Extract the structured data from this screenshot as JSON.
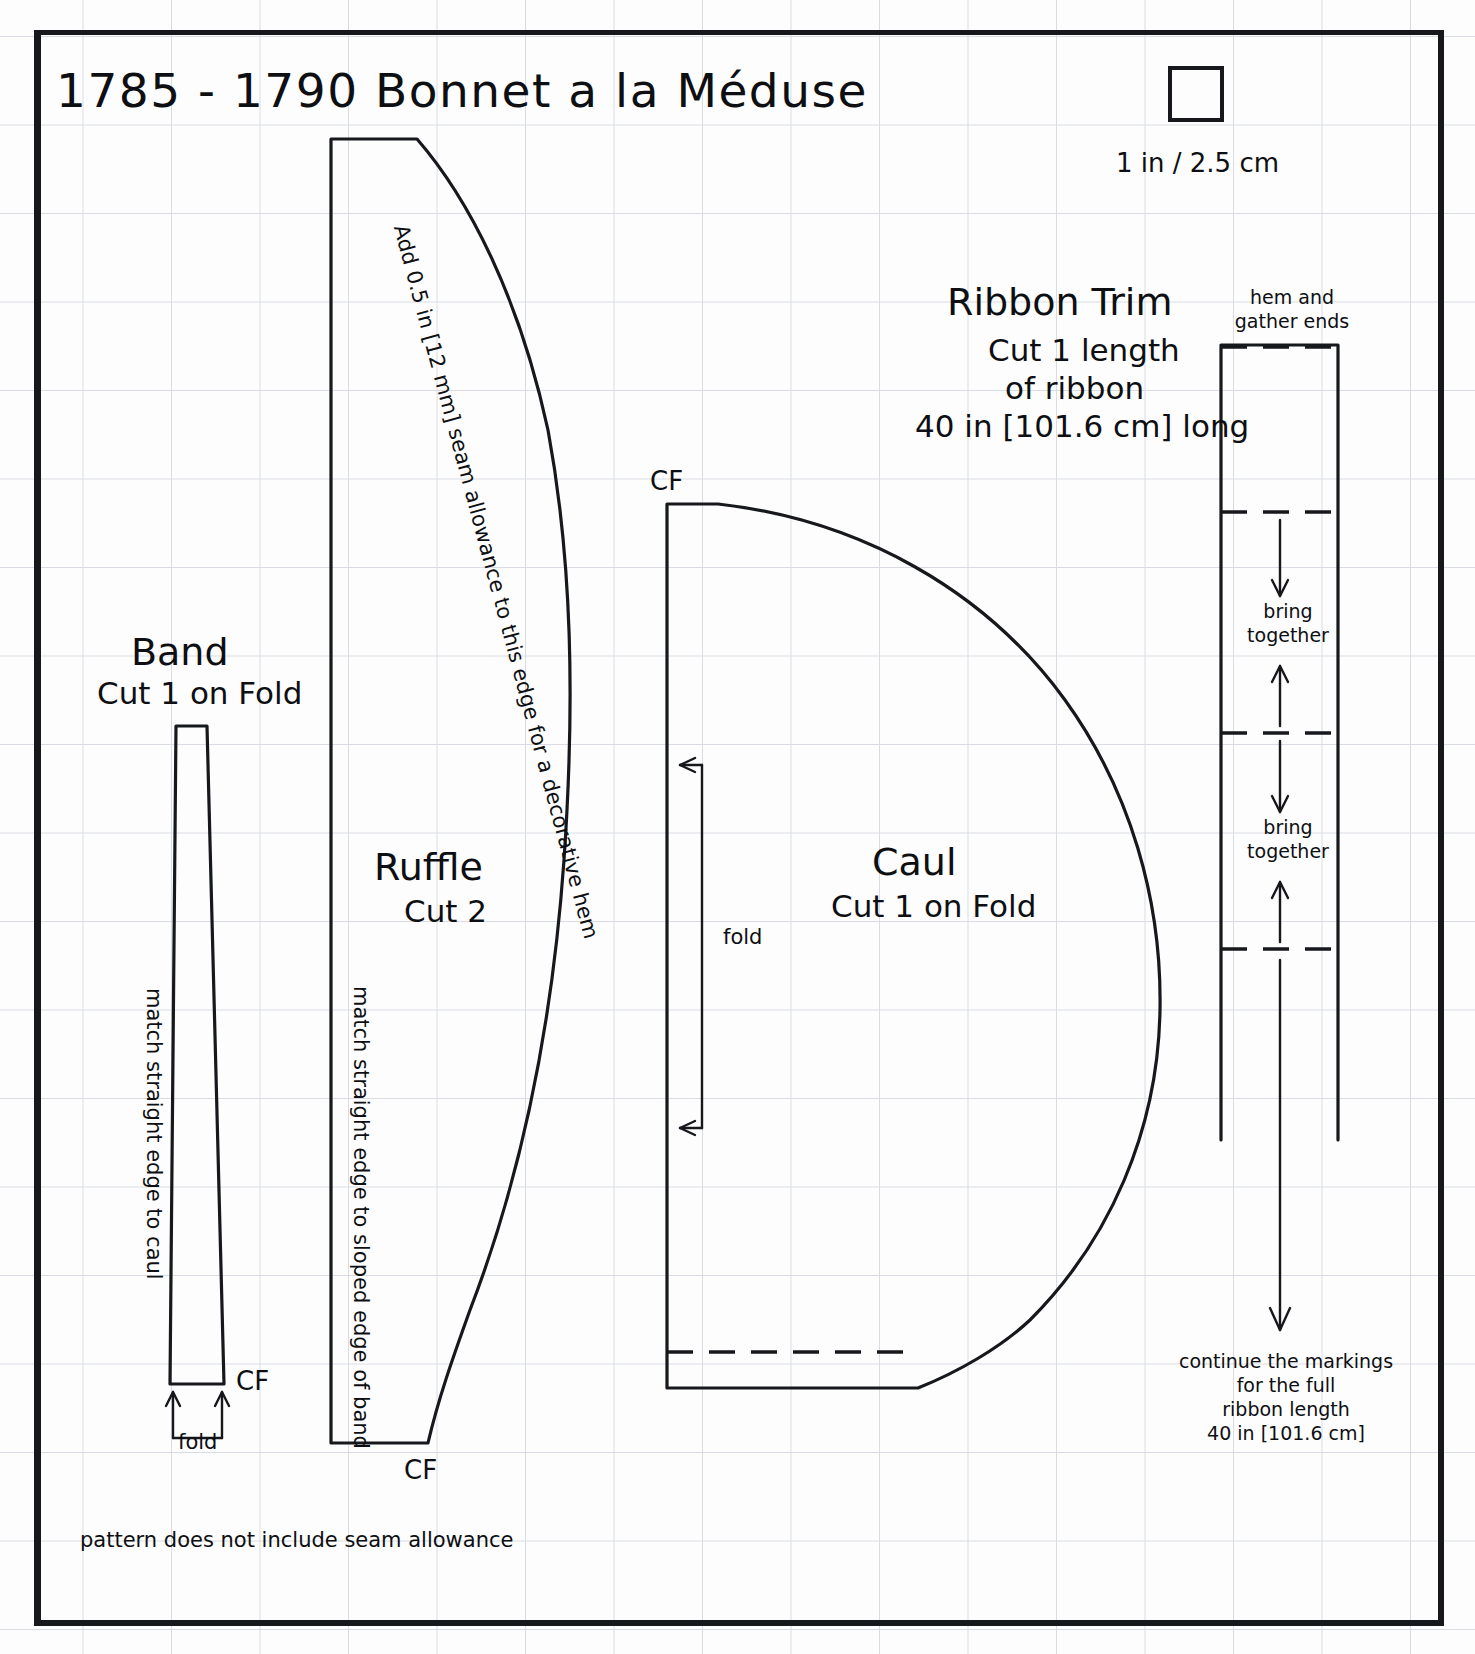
{
  "document": {
    "title": "1785 - 1790 Bonnet a la Méduse",
    "footer_note": "pattern does not include seam allowance"
  },
  "scale": {
    "label": "1 in / 2.5 cm",
    "box_name": "one-inch-scale-square"
  },
  "pieces": {
    "band": {
      "name": "Band",
      "cut": "Cut 1 on Fold",
      "grain_note": "match straight edge to caul",
      "cf_marker": "CF",
      "fold_marker": "fold"
    },
    "ruffle": {
      "name": "Ruffle",
      "cut": "Cut 2",
      "grain_note": "match straight edge to sloped edge of band",
      "seam_note": "Add 0.5 in [12 mm] seam allowance to this edge for a decorative hem",
      "cf_marker": "CF"
    },
    "caul": {
      "name": "Caul",
      "cut": "Cut 1 on Fold",
      "cf_marker": "CF",
      "fold_marker": "fold"
    },
    "ribbon": {
      "name": "Ribbon Trim",
      "cut_line_1": "Cut 1 length",
      "cut_line_2": "of ribbon",
      "length": "40 in [101.6 cm] long",
      "hem_note_line_1": "hem and",
      "hem_note_line_2": "gather ends",
      "bring_together_1_line_1": "bring",
      "bring_together_1_line_2": "together",
      "bring_together_2_line_1": "bring",
      "bring_together_2_line_2": "together",
      "continue_note_line_1": "continue the markings",
      "continue_note_line_2": "for the full",
      "continue_note_line_3": "ribbon length",
      "continue_note_line_4": "40 in [101.6 cm]"
    }
  },
  "colors": {
    "ink": "#16181c",
    "grid": "#d9dde3",
    "paper": "#fdfdfd"
  }
}
